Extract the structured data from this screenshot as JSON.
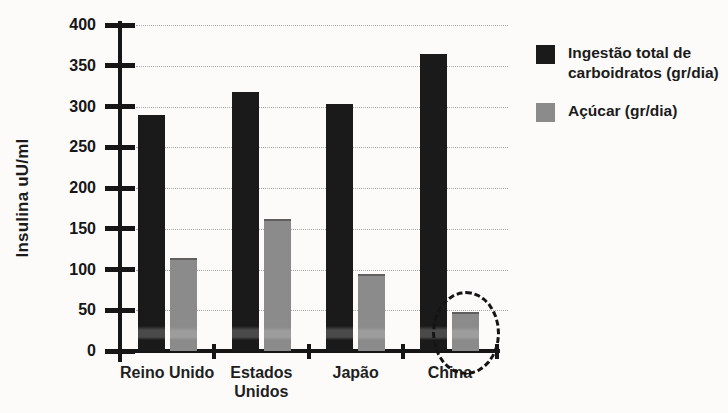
{
  "figure": {
    "background": "#fcfbfa"
  },
  "chart_data": {
    "type": "bar",
    "title": "",
    "xlabel": "",
    "ylabel": "Insulina uU/ml",
    "ylim": [
      0,
      400
    ],
    "yticks": [
      0,
      50,
      100,
      150,
      200,
      250,
      300,
      350,
      400
    ],
    "grid": "horizontal-dotted",
    "legend_position": "right",
    "categories": [
      "Reino Unido",
      "Estados Unidos",
      "Japão",
      "China"
    ],
    "series": [
      {
        "name": "Ingestão total de carboidratos (gr/dia)",
        "color": "#1a1a1a",
        "values": [
          290,
          318,
          303,
          365
        ]
      },
      {
        "name": "Açúcar (gr/dia)",
        "color": "#8b8b8b",
        "values": [
          112,
          160,
          92,
          45
        ]
      }
    ],
    "annotation": {
      "type": "dashed-circle",
      "category": "China",
      "series": "Açúcar (gr/dia)",
      "color": "#141414"
    }
  },
  "colors": {
    "axis": "#161616",
    "gridline": "#a9a9a9",
    "text": "#1b1b1b",
    "gray_bar_top_edge": "#5f5f5f"
  }
}
